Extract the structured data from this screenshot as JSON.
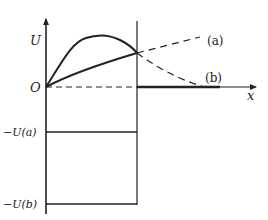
{
  "diagram": {
    "axes": {
      "y_label": "U",
      "x_label": "x",
      "origin_label": "O"
    },
    "curve_labels": {
      "a": "(a)",
      "b": "(b)"
    },
    "levels": {
      "neg_ua": "−U(a)",
      "neg_ub": "−U(b)"
    },
    "colors": {
      "stroke": "#222222",
      "background": "#ffffff"
    }
  }
}
